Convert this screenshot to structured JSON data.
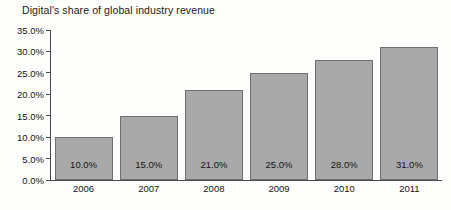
{
  "chart_data": {
    "type": "bar",
    "title": "Digital's share of global industry revenue",
    "xlabel": "",
    "ylabel": "",
    "categories": [
      "2006",
      "2007",
      "2008",
      "2009",
      "2010",
      "2011"
    ],
    "values": [
      10.0,
      15.0,
      21.0,
      25.0,
      28.0,
      31.0
    ],
    "data_labels": [
      "10.0%",
      "15.0%",
      "21.0%",
      "25.0%",
      "28.0%",
      "31.0%"
    ],
    "ylim": [
      0,
      35
    ],
    "ytick_values": [
      35.0,
      30.0,
      25.0,
      20.0,
      15.0,
      10.0,
      5.0,
      0.0
    ],
    "ytick_labels": [
      "35.0%",
      "30.0%",
      "25.0%",
      "20.0%",
      "15.0%",
      "10.0%",
      "5.0%",
      "0.0%"
    ],
    "grid": false,
    "legend": null,
    "bar_color": "#a9a9a9",
    "bar_border_color": "#6f6f6f",
    "axis_color": "#4a4a4a",
    "background_color": "#fdfdfb"
  }
}
